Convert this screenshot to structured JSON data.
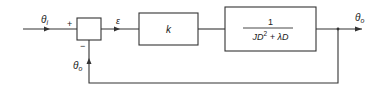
{
  "diagram": {
    "type": "feedback-control-block-diagram",
    "signals": {
      "input": {
        "symbol": "θ",
        "subscript": "i"
      },
      "error": {
        "symbol": "ε"
      },
      "output": {
        "symbol": "θ",
        "subscript": "o"
      },
      "feedback": {
        "symbol": "θ",
        "subscript": "o"
      }
    },
    "summing_junction": {
      "plus_sign": "+",
      "minus_sign": "−"
    },
    "blocks": [
      {
        "id": "gain",
        "label": "k"
      },
      {
        "id": "plant",
        "numerator": "1",
        "denominator_part1": "JD",
        "denominator_exp": "2",
        "denominator_part2": " + λD"
      }
    ],
    "colors": {
      "line": "#333333",
      "text": "#222222",
      "background": "#ffffff"
    }
  }
}
